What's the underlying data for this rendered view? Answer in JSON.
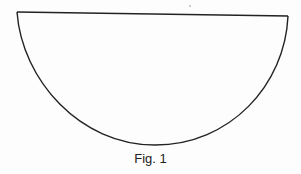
{
  "figure": {
    "caption": "Fig. 1",
    "shape": "semicircle",
    "stroke_color": "#222222",
    "background_color": "#fdfdfd"
  }
}
